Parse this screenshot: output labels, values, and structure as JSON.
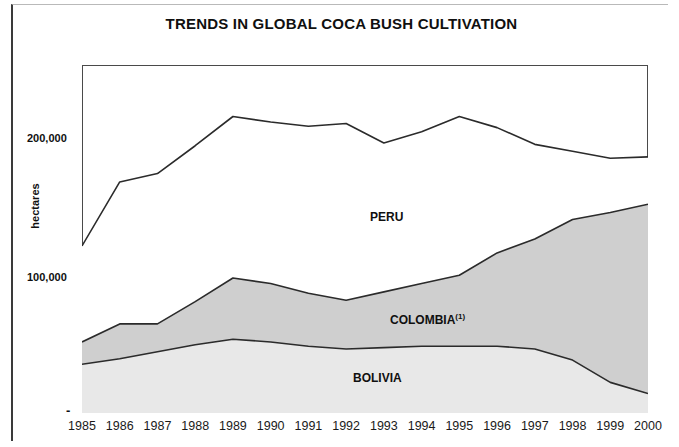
{
  "figure": {
    "title": "TRENDS IN GLOBAL COCA BUSH CULTIVATION",
    "yaxis_title": "hectares",
    "zero_tick": "-",
    "ytick_200000": "200,000",
    "ytick_100000": "100,000",
    "footnote": ""
  },
  "series_labels": {
    "peru": "PERU",
    "colombia": "COLOMBIA",
    "colombia_footnote": "(1)",
    "bolivia": "BOLIVIA"
  },
  "colors": {
    "line": "#2b2b2b",
    "colombia_fill": "#cfcfcf",
    "bolivia_fill": "#e8e8e8",
    "peru_fill": "#ffffff",
    "frame": "#4a4a4a",
    "text": "#101010"
  },
  "chart_data": {
    "type": "area",
    "title": "TRENDS IN GLOBAL COCA BUSH CULTIVATION",
    "subtitle": "",
    "xlabel": "",
    "ylabel": "hectares",
    "stacked": true,
    "grid": false,
    "legend": "inline-labels",
    "ylim": [
      0,
      250000
    ],
    "yticks": [
      0,
      100000,
      200000
    ],
    "ytick_labels": [
      "-",
      "100,000",
      "200,000"
    ],
    "categories": [
      1985,
      1986,
      1987,
      1988,
      1989,
      1990,
      1991,
      1992,
      1993,
      1994,
      1995,
      1996,
      1997,
      1998,
      1999,
      2000
    ],
    "series": [
      {
        "name": "BOLIVIA",
        "values": [
          35000,
          39000,
          44000,
          49000,
          53000,
          51000,
          48000,
          46000,
          47000,
          48000,
          48000,
          48000,
          46000,
          38000,
          22000,
          14000
        ]
      },
      {
        "name": "COLOMBIA",
        "values": [
          16000,
          25000,
          20000,
          31000,
          44000,
          42000,
          38000,
          35000,
          40000,
          45000,
          51000,
          67000,
          79000,
          101000,
          122000,
          136000
        ]
      },
      {
        "name": "PERU",
        "values": [
          69000,
          102000,
          108000,
          112000,
          116000,
          116000,
          120000,
          127000,
          107000,
          109000,
          114000,
          90000,
          68000,
          49000,
          39000,
          34000
        ]
      }
    ],
    "cumulative": {
      "bolivia_top": [
        35000,
        39000,
        44000,
        49000,
        53000,
        51000,
        48000,
        46000,
        47000,
        48000,
        48000,
        48000,
        46000,
        38000,
        22000,
        14000
      ],
      "colombia_top": [
        51000,
        64000,
        64000,
        80000,
        97000,
        93000,
        86000,
        81000,
        87000,
        93000,
        99000,
        115000,
        125000,
        139000,
        144000,
        150000
      ],
      "total_top": [
        120000,
        166000,
        172000,
        192000,
        213000,
        209000,
        206000,
        208000,
        194000,
        202000,
        213000,
        205000,
        193000,
        188000,
        183000,
        184000
      ]
    }
  }
}
